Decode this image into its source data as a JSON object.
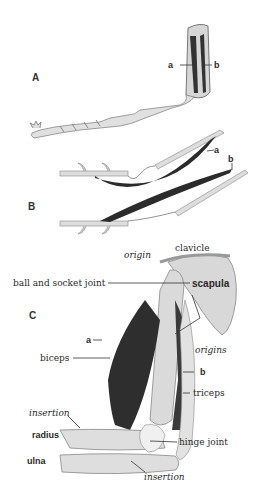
{
  "diagram": {
    "panels": [
      {
        "id": "A",
        "label": "A",
        "description": "Insect leg segment with paired muscles",
        "labels": {
          "a": "a",
          "b": "b"
        }
      },
      {
        "id": "B",
        "label": "B",
        "description": "Schematic of flexor and extensor muscles across joint",
        "labels": {
          "a": "a",
          "b": "b"
        }
      },
      {
        "id": "C",
        "label": "C",
        "description": "Human arm with biceps and triceps",
        "labels": {
          "origin": "origin",
          "clavicle": "clavicle",
          "ball_socket": "ball and socket joint",
          "scapula": "scapula",
          "origins": "origins",
          "a": "a",
          "biceps": "biceps",
          "b": "b",
          "triceps": "triceps",
          "insertion_top": "insertion",
          "radius": "radius",
          "hinge_joint": "hinge joint",
          "ulna": "ulna",
          "insertion_bottom": "insertion"
        }
      }
    ],
    "colors": {
      "muscle": "#2b2b2b",
      "bone": "#dcdcdc",
      "outline": "#7a7a7a",
      "background": "#ffffff"
    }
  }
}
